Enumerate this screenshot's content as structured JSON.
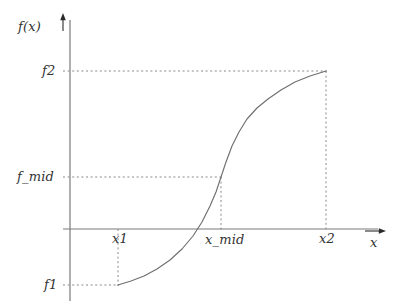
{
  "figure": {
    "kind": "function-plot",
    "background_color": "#ffffff",
    "axis_color": "#7a7a7a",
    "curve_color": "#6f6f6f",
    "guide_color": "#8a8a8a",
    "text_color": "#333333"
  },
  "axes": {
    "y_axis_label": "f(x)",
    "x_axis_label": "x",
    "y_axis_arrow": "arrow-up-icon",
    "x_axis_arrow": "arrow-right-icon"
  },
  "y_ticks": [
    {
      "id": "f2",
      "label": "f2",
      "py": 71
    },
    {
      "id": "f_mid",
      "label": "f_mid",
      "py": 177
    },
    {
      "id": "f1",
      "label": "f1",
      "py": 285
    }
  ],
  "x_ticks": [
    {
      "id": "x1",
      "label": "x1",
      "px": 118
    },
    {
      "id": "x_mid",
      "label": "x_mid",
      "px": 221
    },
    {
      "id": "x2",
      "label": "x2",
      "px": 326
    }
  ],
  "chart_data": {
    "type": "line",
    "title": "",
    "xlabel": "x",
    "ylabel": "f(x)",
    "grid": false,
    "legend": null,
    "annotations": [
      {
        "label": "x1",
        "axis": "x"
      },
      {
        "label": "x_mid",
        "axis": "x"
      },
      {
        "label": "x2",
        "axis": "x"
      },
      {
        "label": "f1",
        "axis": "y"
      },
      {
        "label": "f_mid",
        "axis": "y"
      },
      {
        "label": "f2",
        "axis": "y"
      }
    ],
    "points_of_interest": [
      {
        "name": "start",
        "x": "x1",
        "y": "f1"
      },
      {
        "name": "midpoint",
        "x": "x_mid",
        "y": "f_mid"
      },
      {
        "name": "end",
        "x": "x2",
        "y": "f2"
      },
      {
        "name": "root",
        "x": "",
        "y": "0"
      }
    ],
    "series": [
      {
        "name": "f",
        "points_px": [
          [
            118,
            285
          ],
          [
            131,
            281
          ],
          [
            144,
            276
          ],
          [
            157,
            269
          ],
          [
            170,
            260
          ],
          [
            182,
            249
          ],
          [
            193,
            236
          ],
          [
            202,
            222
          ],
          [
            210,
            206
          ],
          [
            216,
            192
          ],
          [
            221,
            177
          ],
          [
            226,
            162
          ],
          [
            232,
            146
          ],
          [
            239,
            132
          ],
          [
            247,
            119
          ],
          [
            257,
            108
          ],
          [
            268,
            99
          ],
          [
            281,
            90
          ],
          [
            295,
            82
          ],
          [
            310,
            76
          ],
          [
            326,
            71
          ]
        ]
      }
    ]
  }
}
